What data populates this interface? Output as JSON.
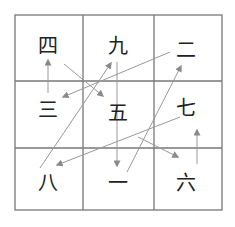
{
  "diagram": {
    "type": "lo-shu-magic-square-path",
    "grid": {
      "rows": 3,
      "cols": 3,
      "cells": [
        [
          "四",
          "九",
          "二"
        ],
        [
          "三",
          "五",
          "七"
        ],
        [
          "八",
          "一",
          "六"
        ]
      ]
    },
    "cell_positions": {
      "四": [
        48,
        46
      ],
      "九": [
        118,
        46
      ],
      "二": [
        186,
        50
      ],
      "三": [
        48,
        110
      ],
      "五": [
        118,
        113
      ],
      "七": [
        186,
        110
      ],
      "八": [
        48,
        183
      ],
      "一": [
        118,
        183
      ],
      "六": [
        186,
        183
      ]
    },
    "path": [
      {
        "from": "一",
        "to": "二"
      },
      {
        "from": "二",
        "to": "三"
      },
      {
        "from": "三",
        "to": "四"
      },
      {
        "from": "四",
        "to": "五"
      },
      {
        "from": "五",
        "to": "六"
      },
      {
        "from": "六",
        "to": "七"
      },
      {
        "from": "七",
        "to": "八"
      },
      {
        "from": "八",
        "to": "九"
      },
      {
        "from": "九",
        "to": "一"
      }
    ],
    "colors": {
      "grid": "#777777",
      "arrow": "#999999",
      "text": "#222222",
      "background": "#ffffff"
    }
  }
}
